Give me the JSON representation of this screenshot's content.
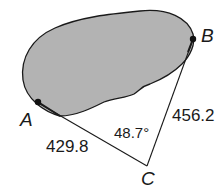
{
  "diagram": {
    "type": "surveying-triangle",
    "points": {
      "A": {
        "label": "A"
      },
      "B": {
        "label": "B"
      },
      "C": {
        "label": "C"
      }
    },
    "measurements": {
      "side_AC": "429.8",
      "side_BC": "456.2",
      "angle_C": "48.7°"
    },
    "colors": {
      "region_fill": "#b3b3b3",
      "stroke": "#1a1a1a"
    }
  }
}
